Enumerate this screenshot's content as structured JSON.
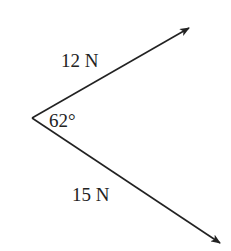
{
  "diagram": {
    "type": "force-vectors",
    "vertex": {
      "x": 32,
      "y": 118
    },
    "colors": {
      "stroke": "#222222",
      "background": "#ffffff"
    },
    "vectors": [
      {
        "name": "upper-force",
        "label": "12 N",
        "magnitude": 12,
        "unit": "N",
        "tip": {
          "x": 189,
          "y": 28
        },
        "label_pos": {
          "x": 61,
          "y": 67
        }
      },
      {
        "name": "lower-force",
        "label": "15 N",
        "magnitude": 15,
        "unit": "N",
        "tip": {
          "x": 220,
          "y": 243
        },
        "label_pos": {
          "x": 72,
          "y": 201
        }
      }
    ],
    "angle": {
      "label": "62°",
      "value": 62,
      "label_pos": {
        "x": 49,
        "y": 127
      }
    }
  }
}
